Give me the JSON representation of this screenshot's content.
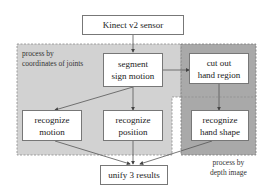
{
  "diagram": {
    "nodes": {
      "sensor": {
        "label": "Kinect v2 sensor"
      },
      "segment": {
        "line1": "segment",
        "line2": "sign motion"
      },
      "cutout": {
        "line1": "cut out",
        "line2": "hand region"
      },
      "rec_motion": {
        "line1": "recognize",
        "line2": "motion"
      },
      "rec_position": {
        "line1": "recognize",
        "line2": "position"
      },
      "rec_hand": {
        "line1": "recognize",
        "line2": "hand shape"
      },
      "unify": {
        "label": "unify 3 results"
      }
    },
    "regions": {
      "joints": {
        "line1": "process by",
        "line2": "coordinates of joints",
        "color": "#d2d2d2"
      },
      "depth": {
        "line1": "process by",
        "line2": "depth image",
        "color": "#a9a9a9"
      }
    },
    "edges": [
      [
        "sensor",
        "segment"
      ],
      [
        "segment",
        "cutout"
      ],
      [
        "segment",
        "rec_motion"
      ],
      [
        "segment",
        "rec_position"
      ],
      [
        "cutout",
        "rec_hand"
      ],
      [
        "rec_motion",
        "unify"
      ],
      [
        "rec_position",
        "unify"
      ],
      [
        "rec_hand",
        "unify"
      ]
    ]
  }
}
